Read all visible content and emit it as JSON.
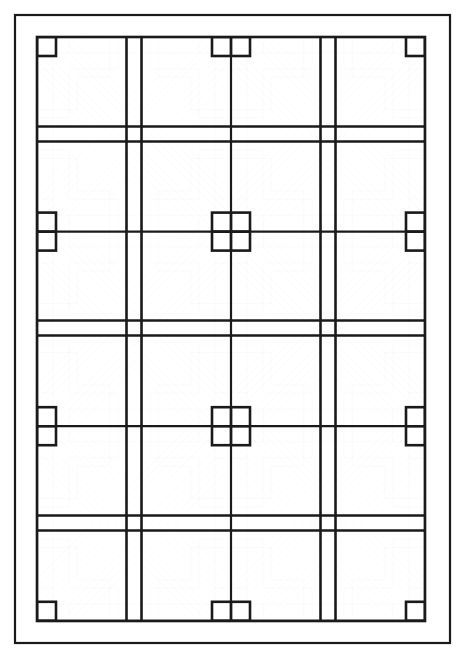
{
  "page": {
    "width": 466,
    "height": 659,
    "background_color": "#ffffff",
    "line_color": "#1a1a1a"
  },
  "border": {
    "name": "outer-frame",
    "x": 15,
    "y": 15,
    "width": 435,
    "height": 628,
    "stroke_width": 2.2
  },
  "pattern": {
    "name": "quilt-pattern",
    "x": 37,
    "y": 37,
    "width": 388,
    "height": 584,
    "stroke_width": 2.6,
    "thin_stroke_width": 2.2,
    "columns": 2,
    "rows": 3,
    "cell_width": 194,
    "cell_height": 194.6,
    "band_width": 15,
    "center_square_half": 19,
    "star_centers": [
      {
        "x": 134,
        "y": 134
      },
      {
        "x": 328,
        "y": 134
      },
      {
        "x": 134,
        "y": 328
      },
      {
        "x": 328,
        "y": 328
      },
      {
        "x": 134,
        "y": 523
      },
      {
        "x": 328,
        "y": 523
      }
    ],
    "corner_squares": [
      {
        "x": 231,
        "y": 231
      },
      {
        "x": 231,
        "y": 426
      },
      {
        "x": 37,
        "y": 231
      },
      {
        "x": 425,
        "y": 231
      },
      {
        "x": 37,
        "y": 426
      },
      {
        "x": 425,
        "y": 426
      }
    ],
    "motif": "eight-point-star with mitred diagonal bands and stepped L corners"
  }
}
